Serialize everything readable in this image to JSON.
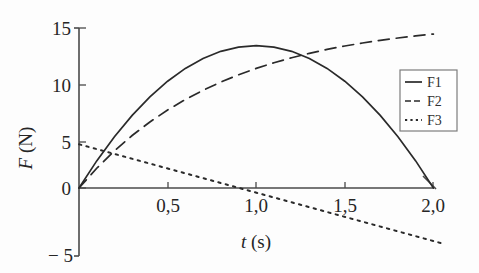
{
  "chart_data": {
    "type": "line",
    "title": "",
    "xlabel": "t (s)",
    "ylabel": "F (N)",
    "xlim": [
      0,
      2.1
    ],
    "ylim": [
      -5,
      15
    ],
    "grid": false,
    "legend_position": "right-upper-inside",
    "x_tick_labels": [
      "0,5",
      "1,0",
      "1,5",
      "2,0"
    ],
    "x_tick_values": [
      0.5,
      1.0,
      1.5,
      2.0
    ],
    "y_tick_labels": [
      "15",
      "10",
      "5",
      "0",
      "− 5"
    ],
    "y_tick_values": [
      15,
      10,
      5,
      0,
      -5
    ],
    "decimal_separator": ",",
    "series": [
      {
        "name": "F1",
        "style": "solid",
        "description": "parabola, zero at t=0 and t=2.0 s, peak 13.35 N at t=1.0 s",
        "x": [
          0.0,
          0.1,
          0.2,
          0.3,
          0.4,
          0.5,
          0.6,
          0.7,
          0.8,
          0.9,
          1.0,
          1.1,
          1.2,
          1.3,
          1.4,
          1.5,
          1.6,
          1.7,
          1.8,
          1.9,
          2.0
        ],
        "values": [
          0.0,
          2.54,
          4.81,
          6.81,
          8.54,
          10.01,
          11.21,
          12.14,
          12.81,
          13.21,
          13.35,
          13.21,
          12.81,
          12.14,
          11.21,
          10.01,
          8.54,
          6.81,
          4.81,
          2.54,
          0.0
        ]
      },
      {
        "name": "F2",
        "style": "dashed",
        "description": "saturating exponential rise toward about 13.1 N",
        "x": [
          0.0,
          0.1,
          0.2,
          0.3,
          0.4,
          0.5,
          0.6,
          0.7,
          0.8,
          0.9,
          1.0,
          1.1,
          1.2,
          1.3,
          1.4,
          1.5,
          1.6,
          1.7,
          1.8,
          1.9,
          2.0
        ],
        "values": [
          0.0,
          1.85,
          3.48,
          4.92,
          6.19,
          7.31,
          8.29,
          9.16,
          9.93,
          10.61,
          11.21,
          11.74,
          12.21,
          12.62,
          12.99,
          13.31,
          13.59,
          13.84,
          14.06,
          14.26,
          14.43
        ]
      },
      {
        "name": "F3",
        "style": "dotted",
        "description": "straight line decreasing from about 4.1 N at t=0 to about -5.2 N at t=2.05 s; crosses zero near t=0.9 s",
        "x": [
          0.0,
          2.05
        ],
        "values": [
          4.1,
          -5.2
        ]
      }
    ],
    "annotations": [
      {
        "text": "F1 crosses F2 near t = 1.32 s at F ≈ 12.0 N"
      },
      {
        "text": "x axis drawn with arrowhead at right end"
      }
    ]
  },
  "legend": {
    "entries": [
      {
        "label": "F1",
        "style": "solid"
      },
      {
        "label": "F2",
        "style": "dashed"
      },
      {
        "label": "F3",
        "style": "dotted"
      }
    ]
  },
  "axes": {
    "y_label_main": "F",
    "y_label_unit": " (N)",
    "x_label_main": "t",
    "x_label_unit": " (s)"
  }
}
